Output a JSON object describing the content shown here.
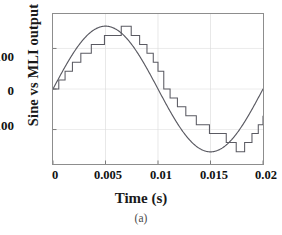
{
  "chart_data": {
    "type": "line",
    "title": "",
    "caption": "(a)",
    "xlabel": "Time (s)",
    "ylabel": "Sine vs MLI output",
    "xlim": [
      0,
      0.02
    ],
    "ylim": [
      -185,
      185
    ],
    "grid": true,
    "grid_style": "faint vertical and horizontal gridlines",
    "legend": "none",
    "xticks": [
      "0",
      "0.005",
      "0.01",
      "0.015",
      "0.02"
    ],
    "xtick_values": [
      0,
      0.005,
      0.01,
      0.015,
      0.02
    ],
    "yticks": [
      "100",
      "0",
      "-100"
    ],
    "ytick_values": [
      100,
      0,
      -100
    ],
    "line_color": "#5a5a62",
    "series": [
      {
        "name": "Sine reference",
        "type": "line",
        "description": "Sinusoid, amplitude 155 V, frequency 50 Hz, one full cycle over 0.02 s",
        "amplitude": 155,
        "frequency_hz": 50,
        "x": [
          0,
          0.0005,
          0.001,
          0.0015,
          0.002,
          0.0025,
          0.003,
          0.0035,
          0.004,
          0.0045,
          0.005,
          0.0055,
          0.006,
          0.0065,
          0.007,
          0.0075,
          0.008,
          0.0085,
          0.009,
          0.0095,
          0.01,
          0.0105,
          0.011,
          0.0115,
          0.012,
          0.0125,
          0.013,
          0.0135,
          0.014,
          0.0145,
          0.015,
          0.0155,
          0.016,
          0.0165,
          0.017,
          0.0175,
          0.018,
          0.0185,
          0.019,
          0.0195,
          0.02
        ],
        "y": [
          0,
          24,
          48,
          70,
          91,
          110,
          125,
          139,
          147,
          153,
          155,
          153,
          147,
          139,
          125,
          110,
          91,
          70,
          48,
          24,
          0,
          -24,
          -48,
          -70,
          -91,
          -110,
          -125,
          -139,
          -147,
          -153,
          -155,
          -153,
          -147,
          -139,
          -125,
          -110,
          -91,
          -70,
          -48,
          -24,
          0
        ]
      },
      {
        "name": "MLI staircase output",
        "type": "step",
        "description": "15-level multilevel inverter staircase output, step height approx 22 V, 7 positive levels and 7 negative levels plus zero",
        "levels": 15,
        "step_height": 22,
        "step_x": [
          0,
          0.00055,
          0.00115,
          0.00185,
          0.00265,
          0.00365,
          0.0049,
          0.0065,
          0.00745,
          0.00825,
          0.00895,
          0.00955,
          0.01,
          0.01055,
          0.01115,
          0.01185,
          0.01265,
          0.01365,
          0.0149,
          0.0165,
          0.01745,
          0.01825,
          0.01895,
          0.01955,
          0.02
        ],
        "step_y": [
          0,
          22,
          44,
          66,
          88,
          110,
          132,
          155,
          132,
          110,
          88,
          66,
          44,
          0,
          -22,
          -44,
          -66,
          -88,
          -110,
          -132,
          -155,
          -132,
          -110,
          -88,
          -66
        ]
      }
    ]
  }
}
